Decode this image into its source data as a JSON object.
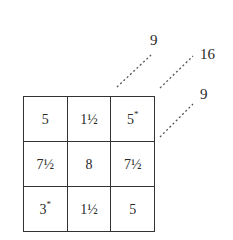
{
  "grid": {
    "rows": [
      [
        {
          "value": "5",
          "mark": ""
        },
        {
          "value": "1½",
          "mark": ""
        },
        {
          "value": "5",
          "mark": "*"
        }
      ],
      [
        {
          "value": "7½",
          "mark": ""
        },
        {
          "value": "8",
          "mark": ""
        },
        {
          "value": "7½",
          "mark": ""
        }
      ],
      [
        {
          "value": "3",
          "mark": "*"
        },
        {
          "value": "1½",
          "mark": ""
        },
        {
          "value": "5",
          "mark": ""
        }
      ]
    ]
  },
  "diagonals": [
    {
      "label": "9",
      "line": {
        "x1": 117,
        "y1": 87,
        "x2": 151,
        "y2": 55
      },
      "label_pos": {
        "x": 150,
        "y": 32
      }
    },
    {
      "label": "16",
      "line": {
        "x1": 160,
        "y1": 88,
        "x2": 193,
        "y2": 56
      },
      "label_pos": {
        "x": 200,
        "y": 46
      }
    },
    {
      "label": "9",
      "line": {
        "x1": 160,
        "y1": 137,
        "x2": 193,
        "y2": 104
      },
      "label_pos": {
        "x": 200,
        "y": 86
      }
    }
  ],
  "colors": {
    "line": "#333333",
    "dash": "#555555",
    "text": "#2a2a2a"
  }
}
